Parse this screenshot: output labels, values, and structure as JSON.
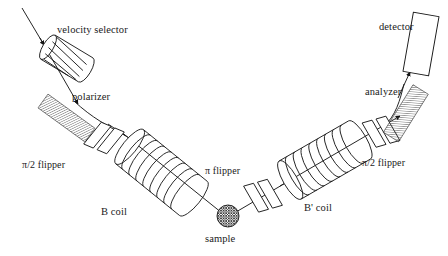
{
  "figure": {
    "background_color": "#ffffff",
    "line_color": "#1a1a1a",
    "hatch_color": "#555555"
  },
  "labels": {
    "velocity_selector": "velocity selector",
    "polarizer": "polarizer",
    "pi_half_flipper_left": "π/2 flipper",
    "b_coil": "B coil",
    "pi_flipper": "π flipper",
    "sample": "sample",
    "b_prime_coil": "B' coil",
    "pi_half_flipper_right": "π/2 flipper",
    "analyzer": "analyzer",
    "detector": "detector"
  },
  "components": [
    {
      "id": "velocity-selector",
      "label": "velocity selector",
      "shape": "helical-cylinder",
      "rings": 5
    },
    {
      "id": "polarizer",
      "label": "polarizer",
      "shape": "hatched-band"
    },
    {
      "id": "pi-half-flipper-left",
      "label": "π/2 flipper",
      "shape": "double-plate"
    },
    {
      "id": "b-coil",
      "label": "B coil",
      "shape": "solenoid",
      "rings": 9
    },
    {
      "id": "pi-flipper",
      "label": "π flipper",
      "shape": "double-plate"
    },
    {
      "id": "sample",
      "label": "sample",
      "shape": "cross-hatched-circle"
    },
    {
      "id": "b-prime-coil",
      "label": "B' coil",
      "shape": "solenoid",
      "rings": 9
    },
    {
      "id": "pi-half-flipper-right",
      "label": "π/2 flipper",
      "shape": "double-plate"
    },
    {
      "id": "analyzer",
      "label": "analyzer",
      "shape": "hatched-band"
    },
    {
      "id": "detector",
      "label": "detector",
      "shape": "rectangle"
    }
  ],
  "beam": {
    "description": "neutron beam path, V-shaped through the instrument",
    "segments": [
      {
        "name": "incident-beam",
        "from": [
          22,
          8
        ],
        "to": [
          78,
          105
        ]
      },
      {
        "name": "polarized-beam",
        "from": [
          78,
          105
        ],
        "to": [
          225,
          215
        ]
      },
      {
        "name": "scattered-beam",
        "from": [
          228,
          216
        ],
        "to": [
          410,
          75
        ]
      },
      {
        "name": "detected-beam",
        "from": [
          410,
          75
        ],
        "to": [
          418,
          62
        ]
      }
    ],
    "arrow_count": 6
  },
  "label_positions": {
    "velocity_selector": {
      "x": 57,
      "y": 25
    },
    "polarizer": {
      "x": 72,
      "y": 92
    },
    "pi_half_flipper_left": {
      "x": 22,
      "y": 160
    },
    "b_coil": {
      "x": 101,
      "y": 207
    },
    "pi_flipper": {
      "x": 205,
      "y": 166
    },
    "sample": {
      "x": 205,
      "y": 234
    },
    "b_prime_coil": {
      "x": 304,
      "y": 203
    },
    "pi_half_flipper_right": {
      "x": 362,
      "y": 158
    },
    "analyzer": {
      "x": 365,
      "y": 87
    },
    "detector": {
      "x": 379,
      "y": 22
    }
  }
}
